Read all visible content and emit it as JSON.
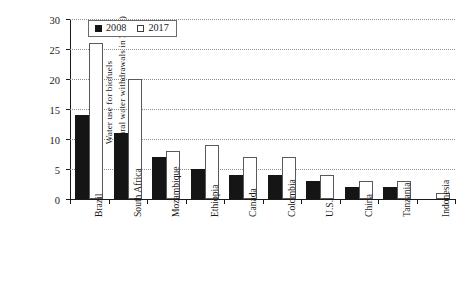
{
  "chart_data": {
    "type": "bar",
    "title": "",
    "xlabel": "",
    "ylabel": "Water use for biofuels (% of agricultural water withdrawals in 2000)",
    "ylabel_line1": "Water use for biofuels",
    "ylabel_line2": "(% of agricultural water withdrawals in 2000)",
    "categories": [
      "Brazil",
      "South Africa",
      "Mozambique",
      "Ethiopia",
      "Canada",
      "Colombia",
      "U.S.",
      "China",
      "Tanzania",
      "Indonesia"
    ],
    "series": [
      {
        "name": "2008",
        "values": [
          14,
          11,
          7,
          5,
          4,
          4,
          3,
          2,
          2,
          0
        ]
      },
      {
        "name": "2017",
        "values": [
          26,
          20,
          8,
          9,
          7,
          7,
          4,
          3,
          3,
          1
        ]
      }
    ],
    "ylim": [
      0,
      30
    ],
    "ytick_values": [
      0,
      5,
      10,
      15,
      20,
      25,
      30
    ],
    "ytick_labels": [
      "0",
      "5",
      "10",
      "15",
      "20",
      "25",
      "30"
    ],
    "grid": true,
    "grid_axis": "y",
    "legend_position": "top-left",
    "colors": {
      "series_2008": "#151515",
      "series_2017": "#ffffff",
      "series_2017_edge": "#5a5a5a",
      "axis": "#1a1a1a",
      "gridline": "#8d8d8d",
      "background": "#ffffff"
    }
  }
}
